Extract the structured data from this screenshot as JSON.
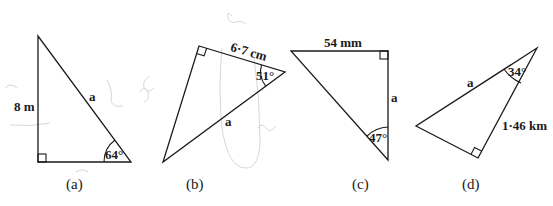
{
  "figures": [
    {
      "id": "a",
      "caption": "(a)",
      "side_label": "8 m",
      "unknown_label": "a",
      "angle_label": "64°",
      "right_angle": true
    },
    {
      "id": "b",
      "caption": "(b)",
      "side_label": "6·7 cm",
      "unknown_label": "a",
      "angle_label": "51°",
      "right_angle": true
    },
    {
      "id": "c",
      "caption": "(c)",
      "side_label": "54 mm",
      "unknown_label": "a",
      "angle_label": "47°",
      "right_angle": true
    },
    {
      "id": "d",
      "caption": "(d)",
      "side_label": "1·46 km",
      "unknown_label": "a",
      "angle_label": "34°",
      "right_angle": true
    }
  ],
  "colors": {
    "ink": "#1a1a1a",
    "pencil": "#d8d8d8",
    "background": "#ffffff"
  }
}
